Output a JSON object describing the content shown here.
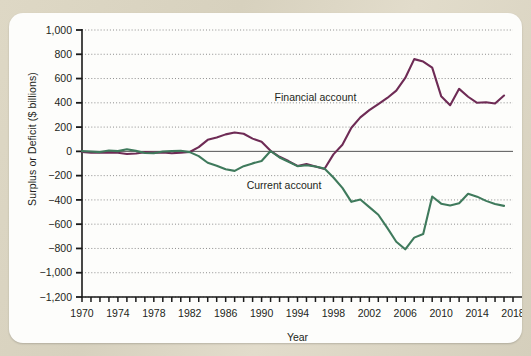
{
  "figure": {
    "background_color": "#d9d3c0",
    "card_color": "#fdfdfb",
    "y_axis_title": "Surplus or Deficit ($ billions)",
    "x_axis_title": "Year"
  },
  "chart_data": {
    "type": "line",
    "title": "",
    "xlabel": "Year",
    "ylabel": "Surplus or Deficit ($ billions)",
    "xlim": [
      1970,
      2018
    ],
    "ylim": [
      -1200,
      1000
    ],
    "ytick_labels": [
      "1,000",
      "800",
      "600",
      "400",
      "200",
      "0",
      "−200",
      "−400",
      "−600",
      "−800",
      "−1,000",
      "−1,200"
    ],
    "ytick_values": [
      1000,
      800,
      600,
      400,
      200,
      0,
      -200,
      -400,
      -600,
      -800,
      -1000,
      -1200
    ],
    "xtick_labels": [
      "1970",
      "1974",
      "1978",
      "1982",
      "1986",
      "1990",
      "1994",
      "1998",
      "2002",
      "2006",
      "2010",
      "2014",
      "2018"
    ],
    "xtick_values": [
      1970,
      1974,
      1978,
      1982,
      1986,
      1990,
      1994,
      1998,
      2002,
      2006,
      2010,
      2014,
      2018
    ],
    "x_minor_tick_interval": 1,
    "grid": "horizontal-dotted",
    "legend": "inline-annotations",
    "annotations": [
      {
        "text": "Financial account",
        "x": 1996.0,
        "y": 415,
        "series": "Financial account"
      },
      {
        "text": "Current account",
        "x": 1992.5,
        "y": -310,
        "series": "Current account"
      }
    ],
    "x": [
      1970,
      1971,
      1972,
      1973,
      1974,
      1975,
      1976,
      1977,
      1978,
      1979,
      1980,
      1981,
      1982,
      1983,
      1984,
      1985,
      1986,
      1987,
      1988,
      1989,
      1990,
      1991,
      1992,
      1993,
      1994,
      1995,
      1996,
      1997,
      1998,
      1999,
      2000,
      2001,
      2002,
      2003,
      2004,
      2005,
      2006,
      2007,
      2008,
      2009,
      2010,
      2011,
      2012,
      2013,
      2014,
      2015,
      2016,
      2017
    ],
    "series": [
      {
        "name": "Financial account",
        "color": "#6e2b55",
        "values": [
          -5,
          -10,
          -12,
          -8,
          -12,
          -22,
          -18,
          -6,
          -10,
          -8,
          -15,
          -10,
          -5,
          35,
          95,
          115,
          140,
          155,
          145,
          105,
          80,
          5,
          -45,
          -80,
          -120,
          -105,
          -125,
          -145,
          -25,
          55,
          195,
          280,
          340,
          390,
          440,
          500,
          605,
          760,
          740,
          690,
          455,
          380,
          515,
          450,
          400,
          405,
          395,
          460
        ]
      },
      {
        "name": "Current account",
        "color": "#3f7a5c",
        "values": [
          2,
          -1,
          -6,
          7,
          2,
          18,
          4,
          -14,
          -15,
          -1,
          2,
          5,
          -6,
          -39,
          -94,
          -118,
          -147,
          -161,
          -122,
          -99,
          -79,
          3,
          -50,
          -85,
          -122,
          -114,
          -125,
          -141,
          -215,
          -301,
          -416,
          -397,
          -459,
          -522,
          -631,
          -745,
          -807,
          -711,
          -681,
          -372,
          -431,
          -446,
          -427,
          -349,
          -373,
          -408,
          -433,
          -449
        ]
      }
    ]
  }
}
